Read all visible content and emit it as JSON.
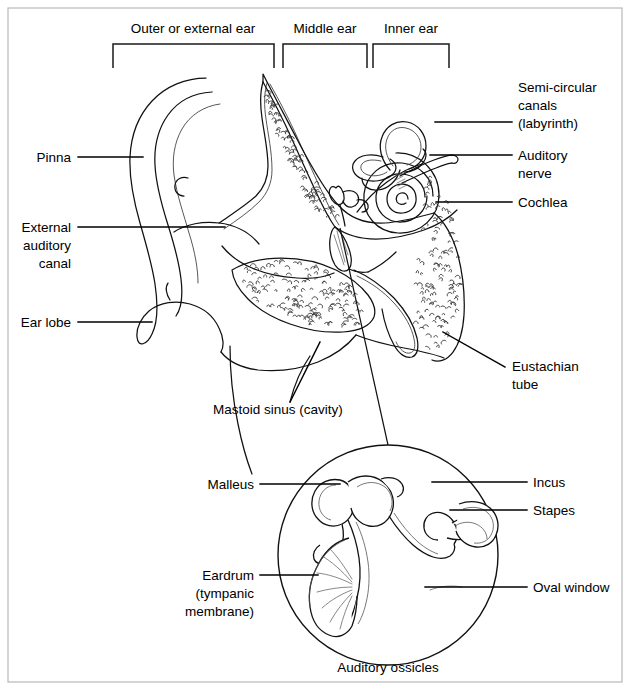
{
  "figure": {
    "caption_inset": "Auditory ossicles"
  },
  "region_brackets": [
    {
      "label": "Outer or external ear",
      "x1": 113,
      "x2": 274,
      "text_x": 193,
      "text_y": 33
    },
    {
      "label": "Middle ear",
      "x1": 283,
      "x2": 367,
      "text_x": 325,
      "text_y": 33
    },
    {
      "label": "Inner ear",
      "x1": 373,
      "x2": 449,
      "text_x": 411,
      "text_y": 33
    }
  ],
  "labels_left": [
    {
      "name": "pinna",
      "lines": [
        "Pinna"
      ],
      "text_x": 71,
      "text_y": 162,
      "leader": [
        [
          78,
          157
        ],
        [
          143,
          157
        ]
      ]
    },
    {
      "name": "external-auditory-canal",
      "lines": [
        "External",
        "auditory",
        "canal"
      ],
      "text_x": 71,
      "text_y": 232,
      "leader": [
        [
          78,
          227
        ],
        [
          225,
          227
        ]
      ]
    },
    {
      "name": "ear-lobe",
      "lines": [
        "Ear lobe"
      ],
      "text_x": 71,
      "text_y": 327,
      "leader": [
        [
          78,
          322
        ],
        [
          152,
          322
        ]
      ]
    }
  ],
  "labels_right": [
    {
      "name": "semi-circular-canals",
      "lines": [
        "Semi-circular",
        "canals",
        "(labyrinth)"
      ],
      "text_x": 518,
      "text_y": 92,
      "leader": [
        [
          435,
          122
        ],
        [
          512,
          122
        ]
      ]
    },
    {
      "name": "auditory-nerve",
      "lines": [
        "Auditory",
        "nerve"
      ],
      "text_x": 518,
      "text_y": 160,
      "leader": [
        [
          430,
          155
        ],
        [
          512,
          155
        ]
      ]
    },
    {
      "name": "cochlea",
      "lines": [
        "Cochlea"
      ],
      "text_x": 518,
      "text_y": 207,
      "leader": [
        [
          436,
          202
        ],
        [
          512,
          202
        ]
      ]
    },
    {
      "name": "eustachian-tube",
      "lines": [
        "Eustachian",
        "tube"
      ],
      "text_x": 512,
      "text_y": 371,
      "leader": [
        [
          443,
          332
        ],
        [
          505,
          367
        ]
      ]
    }
  ],
  "labels_center": [
    {
      "name": "mastoid-sinus",
      "lines": [
        "Mastoid sinus (cavity)"
      ],
      "text_x": 213,
      "text_y": 414,
      "anchor": "start",
      "leader": [
        [
          290,
          402
        ],
        [
          320,
          342
        ]
      ]
    }
  ],
  "inset_labels_left": [
    {
      "name": "malleus",
      "lines": [
        "Malleus"
      ],
      "text_x": 254,
      "text_y": 489,
      "leader": [
        [
          260,
          484
        ],
        [
          340,
          484
        ]
      ]
    },
    {
      "name": "eardrum",
      "lines": [
        "Eardrum",
        "(tympanic",
        "membrane)"
      ],
      "text_x": 254,
      "text_y": 580,
      "leader": [
        [
          260,
          575
        ],
        [
          318,
          575
        ]
      ]
    }
  ],
  "inset_labels_right": [
    {
      "name": "incus",
      "lines": [
        "Incus"
      ],
      "text_x": 533,
      "text_y": 487,
      "leader": [
        [
          432,
          482
        ],
        [
          527,
          482
        ]
      ]
    },
    {
      "name": "stapes",
      "lines": [
        "Stapes"
      ],
      "text_x": 533,
      "text_y": 515,
      "leader": [
        [
          450,
          510
        ],
        [
          527,
          510
        ]
      ]
    },
    {
      "name": "oval-window",
      "lines": [
        "Oval window"
      ],
      "text_x": 533,
      "text_y": 592,
      "leader": [
        [
          425,
          587
        ],
        [
          527,
          587
        ]
      ]
    }
  ],
  "inset": {
    "center_x": 388,
    "center_y": 555,
    "radius": 110,
    "caption_x": 388,
    "caption_y": 672
  },
  "connector_line": [
    [
      340,
      228
    ],
    [
      388,
      445
    ]
  ],
  "frame": {
    "x": 8,
    "y": 8,
    "width": 614,
    "height": 674
  },
  "colors": {
    "ink": "#111111",
    "frame": "#b8b8b8",
    "background": "#ffffff",
    "stipple": "#333333"
  }
}
